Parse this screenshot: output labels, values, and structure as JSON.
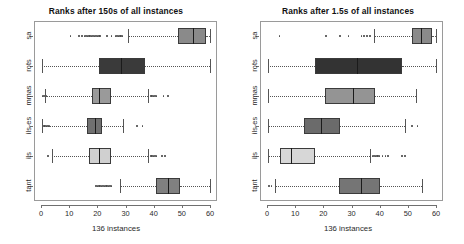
{
  "figure": {
    "xlabel": "136 instances",
    "panels": [
      "left",
      "right"
    ]
  },
  "chart_data": [
    {
      "type": "box",
      "title": "Ranks after 150s of all instances",
      "xlabel": "136 instances",
      "ylabel": "",
      "xlim": [
        0,
        60
      ],
      "xticks": [
        0,
        10,
        20,
        30,
        40,
        50,
        60
      ],
      "xticklabels": [
        "0",
        "10",
        "20",
        "30",
        "40",
        "50",
        "60"
      ],
      "categories": [
        "tant",
        "ils",
        "ils-es",
        "mmas",
        "rots",
        "sa"
      ],
      "grid": false,
      "legend": null,
      "boxes": [
        {
          "label": "tant",
          "whisker_low": 28.0,
          "q1": 41.0,
          "median": 45.0,
          "q3": 49.5,
          "whisker_high": 60.0,
          "color": "#808080",
          "outliers": [
            19.5,
            20.0,
            20.5,
            21.0,
            21.5,
            22.0,
            22.5,
            23.0,
            23.5,
            24.0,
            24.5,
            25.0
          ]
        },
        {
          "label": "ils",
          "whisker_low": 4.0,
          "q1": 17.0,
          "median": 20.5,
          "q3": 25.0,
          "whisker_high": 38.0,
          "color": "#d0d0d0",
          "outliers": [
            2.5,
            39.0,
            39.5,
            40.0,
            40.5,
            41.0,
            43.0,
            44.0
          ]
        },
        {
          "label": "ils-es",
          "whisker_low": 0.5,
          "q1": 16.5,
          "median": 19.0,
          "q3": 21.5,
          "whisker_high": 29.0,
          "color": "#707070",
          "outliers": [
            1.0,
            1.5,
            2.0,
            2.5,
            3.0,
            34.0,
            36.0
          ]
        },
        {
          "label": "mmas",
          "whisker_low": 1.5,
          "q1": 18.0,
          "median": 20.5,
          "q3": 25.0,
          "whisker_high": 38.0,
          "color": "#9a9a9a",
          "outliers": [
            0.5,
            1.0,
            2.0,
            39.0,
            39.5,
            40.0,
            40.5,
            41.0,
            43.5,
            45.0
          ]
        },
        {
          "label": "rots",
          "whisker_low": 0.5,
          "q1": 20.5,
          "median": 28.5,
          "q3": 37.0,
          "whisker_high": 60.0,
          "color": "#3a3a3a",
          "outliers": []
        },
        {
          "label": "sa",
          "whisker_low": 31.0,
          "q1": 48.5,
          "median": 54.0,
          "q3": 58.5,
          "whisker_high": 60.0,
          "color": "#8a8a8a",
          "outliers": [
            10.5,
            13.5,
            14.5,
            15.5,
            16.0,
            16.5,
            17.0,
            17.5,
            18.0,
            18.5,
            19.0,
            19.5,
            20.0,
            20.5,
            21.0,
            23.5,
            25.0,
            26.5,
            27.0,
            27.5,
            28.0,
            28.5,
            29.0
          ]
        }
      ]
    },
    {
      "type": "box",
      "title": "Ranks after 1.5s of all instances",
      "xlabel": "136 instances",
      "ylabel": "",
      "xlim": [
        0,
        60
      ],
      "xticks": [
        0,
        10,
        20,
        30,
        40,
        50,
        60
      ],
      "xticklabels": [
        "0",
        "10",
        "20",
        "30",
        "40",
        "50",
        "60"
      ],
      "categories": [
        "tant",
        "ils",
        "ils-es",
        "mmas",
        "rots",
        "sa"
      ],
      "grid": false,
      "legend": null,
      "boxes": [
        {
          "label": "tant",
          "whisker_low": 3.0,
          "q1": 25.5,
          "median": 33.5,
          "q3": 40.0,
          "whisker_high": 55.0,
          "color": "#757575",
          "outliers": [
            0.8,
            1.6
          ]
        },
        {
          "label": "ils",
          "whisker_low": 0.5,
          "q1": 4.5,
          "median": 8.5,
          "q3": 17.0,
          "whisker_high": 36.5,
          "color": "#d7d7d7",
          "outliers": [
            37.5,
            38.0,
            38.5,
            39.0,
            39.5,
            40.0,
            41.0,
            42.0,
            43.0,
            48.0,
            49.0
          ]
        },
        {
          "label": "ils-es",
          "whisker_low": 0.5,
          "q1": 13.0,
          "median": 19.0,
          "q3": 26.0,
          "whisker_high": 49.0,
          "color": "#6b6b6b",
          "outliers": [
            51.5,
            53.5
          ]
        },
        {
          "label": "mmas",
          "whisker_low": 0.5,
          "q1": 20.5,
          "median": 30.5,
          "q3": 38.5,
          "whisker_high": 53.0,
          "color": "#949494",
          "outliers": []
        },
        {
          "label": "rots",
          "whisker_low": 0.5,
          "q1": 17.0,
          "median": 32.0,
          "q3": 48.0,
          "whisker_high": 60.0,
          "color": "#333333",
          "outliers": []
        },
        {
          "label": "sa",
          "whisker_low": 38.0,
          "q1": 51.5,
          "median": 54.5,
          "q3": 58.5,
          "whisker_high": 60.0,
          "color": "#8a8a8a",
          "outliers": [
            4.5,
            21.0,
            26.0,
            29.0,
            33.5,
            34.5,
            35.5,
            36.5
          ]
        }
      ]
    }
  ]
}
